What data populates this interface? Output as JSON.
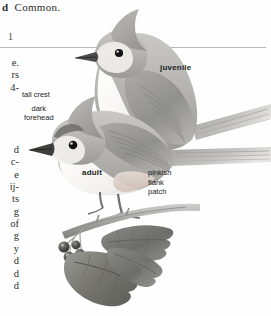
{
  "page": {
    "background_color": "#fefefe",
    "headline_fragment": "d",
    "headline_text": "Common.",
    "page_numeral": "1",
    "divider_rule": true
  },
  "text_column_fragments": [
    "e.",
    "rs",
    "4-",
    "",
    "",
    "",
    "",
    "d",
    "c-",
    "e",
    "ij-",
    "ts",
    "g",
    "of",
    "g",
    "y",
    "d",
    "d",
    "d"
  ],
  "plate": {
    "title": "Tufted Titmouse plate",
    "labels": {
      "juvenile": "juvenile",
      "adult": "adult",
      "tall_crest": "tall crest",
      "dark_forehead": "dark\nforehead",
      "pinkish_flank_patch": "pinkish\nflank\npatch"
    },
    "subjects": [
      {
        "name": "juvenile-titmouse",
        "pose": "perched-upper"
      },
      {
        "name": "adult-titmouse",
        "pose": "perched-lower"
      }
    ],
    "foliage": {
      "name": "holly-branch",
      "leaves": 3,
      "berries": 4
    },
    "colors": {
      "crest_gray": "#a9a8a6",
      "wing_gray": "#9a9a98",
      "belly_white": "#f4f3f1",
      "flank_pink": "#d9c9c2",
      "bill_dark": "#3a3a3a",
      "eye_black": "#1a1a1a",
      "leaf_dark": "#6f6f6d",
      "berry_dark": "#4a4a4a",
      "branch_gray": "#b0afac",
      "rule_color": "#b9b9b9"
    }
  }
}
